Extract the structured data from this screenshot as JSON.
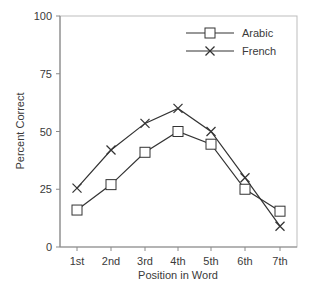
{
  "chart_data": {
    "type": "line",
    "title": "",
    "xlabel": "Position in Word",
    "ylabel": "Percent Correct",
    "categories": [
      "1st",
      "2nd",
      "3rd",
      "4th",
      "5th",
      "6th",
      "7th"
    ],
    "ylim": [
      0,
      100
    ],
    "yticks": [
      0,
      25,
      50,
      75,
      100
    ],
    "grid": false,
    "legend_position": "upper right",
    "series": [
      {
        "name": "Arabic",
        "marker": "square",
        "values": [
          16,
          27,
          41,
          50,
          44.5,
          25,
          15.5
        ]
      },
      {
        "name": "French",
        "marker": "x",
        "values": [
          25.5,
          42,
          53.5,
          60,
          50,
          30,
          9
        ]
      }
    ]
  },
  "colors": {
    "axis": "#8a8a8a",
    "line": "#333333",
    "text": "#3a3a3a"
  }
}
